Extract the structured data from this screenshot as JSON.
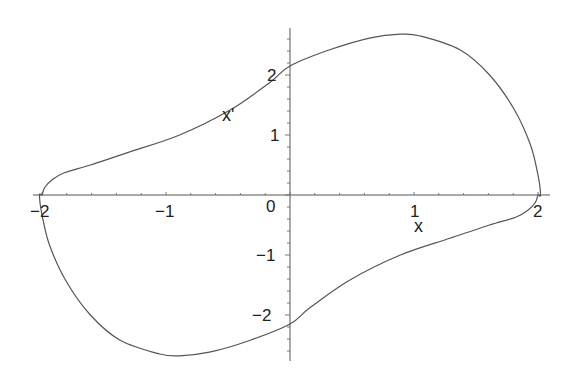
{
  "chart_data": {
    "type": "line",
    "title": "",
    "xlabel": "x",
    "ylabel": "x'",
    "xlim": [
      -2.05,
      2.05
    ],
    "ylim": [
      -2.8,
      2.8
    ],
    "grid": false,
    "legend": null,
    "x_ticks": [
      -2,
      -1,
      0,
      1,
      2
    ],
    "x_tick_labels": [
      "−2",
      "−1",
      "0",
      "1",
      "2"
    ],
    "y_ticks": [
      -2,
      -1,
      1,
      2
    ],
    "y_tick_labels": [
      "−2",
      "−1",
      "1",
      "2"
    ],
    "series": [
      {
        "name": "limit cycle",
        "color": "#555555",
        "closed": true,
        "x": [
          -2.0,
          -1.98,
          -1.92,
          -1.82,
          -1.61,
          -1.29,
          -0.89,
          -0.48,
          -0.16,
          0.0,
          0.32,
          0.65,
          0.89,
          1.05,
          1.37,
          1.61,
          1.81,
          1.94,
          2.0,
          2.02,
          2.0,
          1.98,
          1.92,
          1.82,
          1.61,
          1.29,
          0.89,
          0.48,
          0.16,
          0.0,
          -0.32,
          -0.65,
          -0.89,
          -1.05,
          -1.37,
          -1.61,
          -1.81,
          -1.94,
          -2.0,
          -2.02
        ],
        "y": [
          0.0,
          0.12,
          0.25,
          0.37,
          0.5,
          0.72,
          1.0,
          1.42,
          1.88,
          2.15,
          2.42,
          2.62,
          2.68,
          2.65,
          2.42,
          2.0,
          1.42,
          0.83,
          0.33,
          0.0,
          0.0,
          -0.12,
          -0.25,
          -0.37,
          -0.5,
          -0.72,
          -1.0,
          -1.42,
          -1.88,
          -2.15,
          -2.42,
          -2.62,
          -2.68,
          -2.65,
          -2.42,
          -2.0,
          -1.42,
          -0.83,
          -0.33,
          0.0
        ]
      }
    ],
    "annotations": [
      {
        "text": "x'",
        "x": -0.5,
        "y": 1.35
      },
      {
        "text": "x",
        "x": 1.05,
        "y": -0.55
      }
    ]
  },
  "labels": {
    "x_axis": "x",
    "y_axis": "x'",
    "xt_m2": "−2",
    "xt_m1": "−1",
    "xt_0": "0",
    "xt_1": "1",
    "xt_2": "2",
    "yt_2": "2",
    "yt_1": "1",
    "yt_m1": "−1",
    "yt_m2": "−2"
  }
}
